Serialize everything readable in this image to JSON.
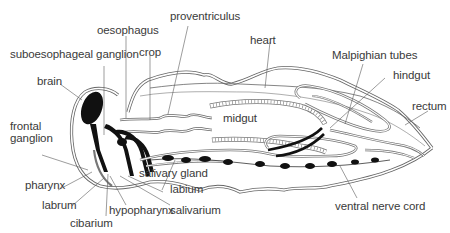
{
  "diagram": {
    "colors": {
      "background": "#ffffff",
      "outline": "#555555",
      "label_text": "#3a3a3a",
      "leader_line": "#5a5a5a",
      "nerve_tissue": "#111111"
    },
    "labels": {
      "oesophagus": "oesophagus",
      "proventriculus": "proventriculus",
      "heart": "heart",
      "suboesophageal_ganglion": "suboesophageal ganglion",
      "crop": "crop",
      "malpighian_tubes": "Malpighian tubes",
      "hindgut": "hindgut",
      "brain": "brain",
      "rectum": "rectum",
      "frontal_ganglion_line1": "frontal",
      "frontal_ganglion_line2": "ganglion",
      "midgut": "midgut",
      "salivary_gland": "salivary gland",
      "pharynx": "pharynx",
      "labium": "labium",
      "labrum": "labrum",
      "hypopharynx": "hypopharynx",
      "salivarium": "salivarium",
      "cibarium": "cibarium",
      "ventral_nerve_cord": "ventral nerve cord"
    }
  }
}
